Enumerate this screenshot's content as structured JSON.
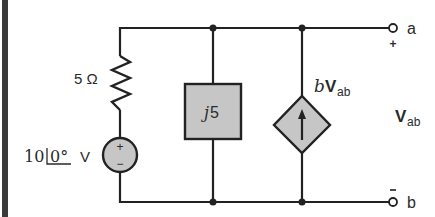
{
  "circuit": {
    "resistor": {
      "label": "5 Ω"
    },
    "voltage_source": {
      "magnitude": "10",
      "angle": "0°",
      "unit": "V",
      "plus": "+",
      "minus": "−"
    },
    "inductor_box": {
      "label_j": "j",
      "label_value": "5"
    },
    "dependent_source": {
      "coef": "b",
      "var": "V",
      "sub": "ab"
    },
    "output": {
      "var": "V",
      "sub": "ab"
    },
    "terminals": {
      "a": {
        "label": "a",
        "polarity": "+"
      },
      "b": {
        "label": "b",
        "polarity": "−"
      }
    }
  },
  "colors": {
    "wire": "#222222",
    "component_fill": "#c6c6c6",
    "left_bar": "#3a3a3a"
  }
}
